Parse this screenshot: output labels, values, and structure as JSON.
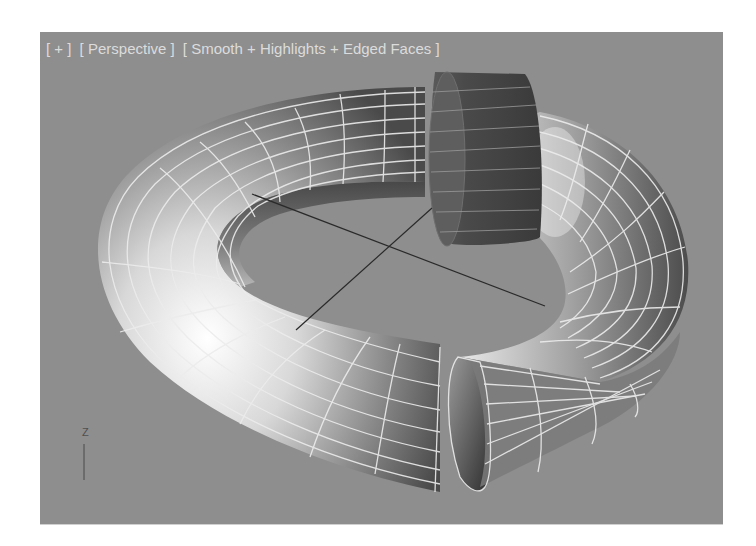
{
  "viewport": {
    "labels": {
      "view_menu": "[ + ]",
      "projection": "[ Perspective ]",
      "shading": "[ Smooth + Highlights + Edged Faces ]"
    },
    "background_color": "#8e8e8e",
    "label_color": "#dcdcdc",
    "axis_gizmo": {
      "label": "Z"
    },
    "objects": [
      {
        "name": "Torus (sliced)",
        "type": "torus",
        "shading": "smooth + highlights",
        "wireframe_color": "#e8e8e8"
      },
      {
        "name": "Torus segment (selected slice)",
        "type": "torus-segment",
        "color": "#4a4a4a"
      }
    ],
    "grid_cross": {
      "color": "#2a2a2a"
    }
  }
}
